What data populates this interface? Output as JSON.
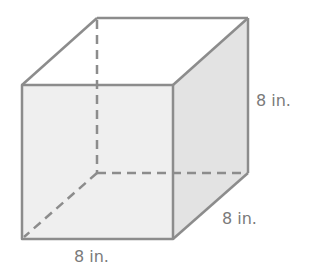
{
  "figure": {
    "type": "cube",
    "colors": {
      "edge": "#8c8c8c",
      "front_face": "#efefef",
      "side_face": "#e2e2e2",
      "top_face": "#ffffff",
      "label": "#7a7a7a"
    },
    "labels": {
      "height": "8 in.",
      "depth": "8 in.",
      "width": "8 in."
    }
  }
}
